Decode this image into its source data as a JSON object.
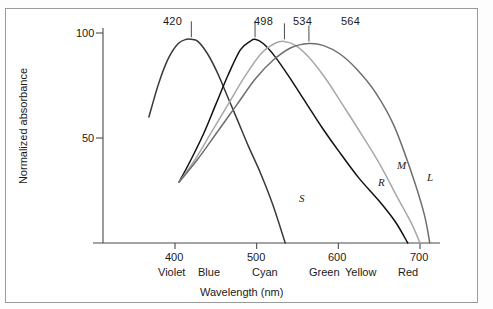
{
  "figure": {
    "name": "cone-photoreceptor-absorbance-spectra",
    "border_color": "#9a9a9a",
    "background": "#ffffff"
  },
  "chart_data": {
    "type": "line",
    "title": "",
    "xlabel": "Wavelength (nm)",
    "ylabel": "Normalized absorbance",
    "xlim": [
      360,
      720
    ],
    "ylim": [
      0,
      105
    ],
    "grid": false,
    "legend": "inline-curve-labels",
    "xticks": [
      400,
      500,
      600,
      700
    ],
    "xtick_labels": [
      "400",
      "500",
      "600",
      "700"
    ],
    "yticks": [
      50,
      100
    ],
    "ytick_labels": [
      "50",
      "100"
    ],
    "color_band_labels": [
      {
        "label": "Violet",
        "wavelength": 405
      },
      {
        "label": "Blue",
        "wavelength": 445
      },
      {
        "label": "Cyan",
        "wavelength": 495
      },
      {
        "label": "Green",
        "wavelength": 553
      },
      {
        "label": "Yellow",
        "wavelength": 583
      },
      {
        "label": "Red",
        "wavelength": 645
      }
    ],
    "series": [
      {
        "name": "S",
        "label": "S",
        "peak_label": "420",
        "peak_wavelength": 420,
        "peak_value": 97,
        "color": "#3a3a3a",
        "x": [
          368,
          380,
          392,
          404,
          414,
          420,
          428,
          440,
          452,
          464,
          476,
          490,
          505,
          520,
          535
        ],
        "y": [
          60,
          76,
          88,
          95,
          97,
          97,
          96,
          90,
          81,
          70,
          59,
          46,
          33,
          18,
          0
        ]
      },
      {
        "name": "R",
        "label": "R",
        "peak_label": "498",
        "peak_wavelength": 498,
        "peak_value": 97,
        "color": "#111111",
        "x": [
          405,
          420,
          435,
          450,
          465,
          480,
          492,
          498,
          508,
          522,
          540,
          560,
          580,
          600,
          625,
          650,
          670,
          685
        ],
        "y": [
          29,
          40,
          52,
          66,
          80,
          92,
          96,
          97,
          95,
          89,
          79,
          67,
          55,
          44,
          31,
          20,
          10,
          0
        ]
      },
      {
        "name": "M",
        "label": "M",
        "peak_label": "534",
        "peak_wavelength": 534,
        "peak_value": 96,
        "color": "#a8a8a8",
        "x": [
          405,
          425,
          445,
          465,
          485,
          505,
          522,
          534,
          548,
          565,
          585,
          605,
          628,
          650,
          672,
          690,
          700
        ],
        "y": [
          29,
          40,
          53,
          66,
          79,
          90,
          95,
          96,
          94,
          88,
          78,
          66,
          52,
          38,
          22,
          9,
          0
        ]
      },
      {
        "name": "L",
        "label": "L",
        "peak_label": "564",
        "peak_wavelength": 564,
        "peak_value": 95,
        "color": "#6e6e6e",
        "x": [
          405,
          428,
          452,
          476,
          498,
          520,
          542,
          564,
          582,
          602,
          622,
          645,
          668,
          690,
          705,
          712
        ],
        "y": [
          29,
          40,
          53,
          66,
          78,
          87,
          93,
          95,
          94,
          90,
          83,
          72,
          56,
          33,
          14,
          0
        ]
      }
    ]
  }
}
